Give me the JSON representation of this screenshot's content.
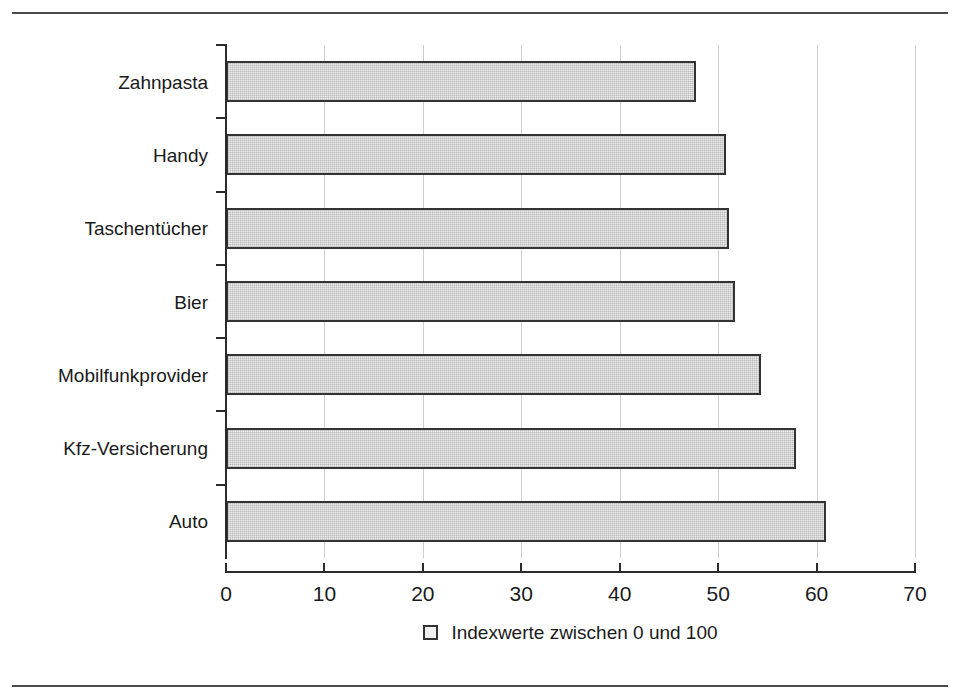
{
  "chart_data": {
    "type": "bar",
    "orientation": "horizontal",
    "title": "",
    "subtitle": "",
    "xlabel": "",
    "ylabel": "",
    "categories": [
      "Zahnpasta",
      "Handy",
      "Taschentücher",
      "Bier",
      "Mobilfunkprovider",
      "Kfz-Versicherung",
      "Auto"
    ],
    "values": [
      47.7,
      50.8,
      51.1,
      51.7,
      54.4,
      57.9,
      61.0
    ],
    "series": [
      {
        "name": "Indexwerte zwischen 0 und 100",
        "values": [
          47.7,
          50.8,
          51.1,
          51.7,
          54.4,
          57.9,
          61.0
        ]
      }
    ],
    "xlim": [
      0,
      70
    ],
    "xticks": [
      0,
      10,
      20,
      30,
      40,
      50,
      60,
      70
    ],
    "xtick_labels": [
      "0",
      "10",
      "20",
      "30",
      "40",
      "50",
      "60",
      "70"
    ],
    "grid": "vertical",
    "legend": {
      "position": "bottom-center",
      "entries": [
        {
          "label": "Indexwerte zwischen 0 und 100",
          "marker": "square",
          "fill": "#efefef",
          "border": "#333333"
        }
      ]
    },
    "colors": {
      "bar_fill": "#ececec",
      "bar_border": "#333333",
      "axis": "#2b2b2b",
      "gridline": "#cfcfcf",
      "text": "#1a1a1a",
      "rule": "#4a4a4a"
    }
  }
}
